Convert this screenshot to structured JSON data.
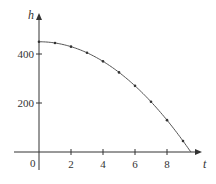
{
  "chart_data": {
    "type": "line",
    "title": "",
    "xlabel": "t",
    "ylabel": "h",
    "xlim": [
      -1.5,
      10.5
    ],
    "ylim": [
      -60,
      520
    ],
    "grid": false,
    "legend": null,
    "x_ticks": [
      0,
      2,
      4,
      6,
      8
    ],
    "x_tick_labels": [
      "0",
      "2",
      "4",
      "6",
      "8"
    ],
    "y_ticks": [
      200,
      400
    ],
    "y_tick_labels": [
      "200",
      "400"
    ],
    "series": [
      {
        "name": "h(t)",
        "x": [
          0,
          1,
          2,
          3,
          4,
          5,
          6,
          7,
          8,
          9,
          9.5
        ],
        "values": [
          450,
          445,
          430,
          405,
          370,
          325,
          270,
          205,
          130,
          45,
          0
        ],
        "markers": [
          0,
          1,
          2,
          3,
          4,
          5,
          6,
          7,
          8,
          9
        ]
      }
    ],
    "colors": {
      "axis": "#333333",
      "curve": "#555555",
      "marker": "#333333"
    }
  },
  "labels": {
    "x_axis": "t",
    "y_axis": "h",
    "origin": "0",
    "xt1": "2",
    "xt2": "4",
    "xt3": "6",
    "xt4": "8",
    "yt1": "200",
    "yt2": "400"
  }
}
